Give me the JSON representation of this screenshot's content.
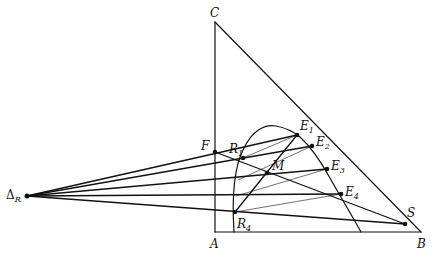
{
  "diagram": {
    "title": "",
    "type": "ternary-extraction-diagram",
    "stroke_color": "#111111",
    "background": "#ffffff",
    "points": {
      "C": {
        "label": "C",
        "x": 215,
        "y": 22,
        "dot": false
      },
      "A": {
        "label": "A",
        "x": 215,
        "y": 232,
        "dot": false
      },
      "B": {
        "label": "B",
        "x": 421,
        "y": 232,
        "dot": false
      },
      "F": {
        "label": "F",
        "x": 215,
        "y": 152,
        "dot": true
      },
      "R1": {
        "label": "R",
        "sub": "1",
        "x": 243,
        "y": 158,
        "dot": true
      },
      "R4": {
        "label": "R",
        "sub": "4",
        "x": 235,
        "y": 212,
        "dot": true
      },
      "M": {
        "label": "M",
        "x": 267,
        "y": 173,
        "dot": true
      },
      "E1": {
        "label": "E",
        "sub": "1",
        "x": 297,
        "y": 135,
        "dot": true
      },
      "E2": {
        "label": "E",
        "sub": "2",
        "x": 312,
        "y": 146,
        "dot": true
      },
      "E3": {
        "label": "E",
        "sub": "3",
        "x": 327,
        "y": 169,
        "dot": true
      },
      "E4": {
        "label": "E",
        "sub": "4",
        "x": 341,
        "y": 194,
        "dot": true
      },
      "S": {
        "label": "S",
        "x": 405,
        "y": 224,
        "dot": true
      },
      "DeltaR": {
        "label": "Δ",
        "sub": "R",
        "x": 27,
        "y": 196,
        "dot": true
      }
    },
    "labels": {
      "C": "C",
      "A": "A",
      "B": "B",
      "F": "F",
      "M": "M",
      "S": "S",
      "R": "R",
      "E": "E",
      "Delta": "Δ",
      "sub1": "1",
      "sub2": "2",
      "sub3": "3",
      "sub4": "4",
      "subR": "R"
    }
  }
}
